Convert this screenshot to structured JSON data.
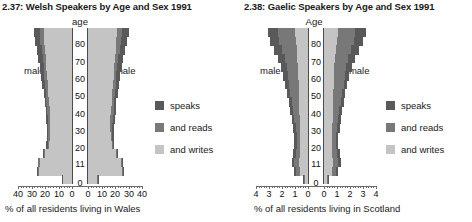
{
  "colors": {
    "speaks": "#595959",
    "and_reads": "#787878",
    "and_writes": "#c4c4c4",
    "axis": "#6b6b6b",
    "text": "#1a1a1a"
  },
  "legend": {
    "items": [
      {
        "label": "speaks",
        "color_key": "speaks"
      },
      {
        "label": "and reads",
        "color_key": "and_reads"
      },
      {
        "label": "and writes",
        "color_key": "and_writes"
      }
    ]
  },
  "panels": [
    {
      "id": "welsh",
      "title": "2.37: Welsh Speakers by Age and Sex 1991",
      "age_axis_label": "age",
      "male_label": "male",
      "female_label": "female",
      "caption": "% of all residents living in Wales",
      "age_ticks": [
        "80",
        "70",
        "60",
        "50",
        "40",
        "30",
        "20",
        "11",
        "0"
      ],
      "value_ticks_left": [
        "40",
        "30",
        "20",
        "10",
        "0"
      ],
      "value_ticks_right": [
        "0",
        "10",
        "20",
        "30",
        "40"
      ],
      "chart_data": {
        "type": "bar",
        "orientation": "population-pyramid",
        "title": "2.37: Welsh Speakers by Age and Sex 1991",
        "xlabel": "% of all residents living in Wales",
        "ylabel": "age",
        "xlim": [
          0,
          40
        ],
        "ylim": [
          0,
          90
        ],
        "grid": false,
        "legend_position": "right",
        "categories": [
          "85+",
          "80-84",
          "75-79",
          "70-74",
          "65-69",
          "60-64",
          "55-59",
          "50-54",
          "45-49",
          "40-44",
          "35-39",
          "30-34",
          "25-29",
          "20-24",
          "16-19",
          "11-15",
          "5-10",
          "3-4"
        ],
        "series": [
          {
            "name": "male speaks",
            "side": "male",
            "layer": "speaks",
            "values": [
              28.5,
              27.5,
              26.0,
              25.0,
              24.0,
              23.0,
              22.0,
              21.0,
              20.0,
              19.5,
              19.0,
              18.5,
              18.5,
              19.0,
              21.5,
              25.5,
              26.0,
              7.5
            ]
          },
          {
            "name": "male and reads",
            "side": "male",
            "layer": "and_reads",
            "values": [
              24.0,
              23.5,
              22.5,
              21.5,
              21.0,
              20.5,
              20.0,
              19.5,
              19.0,
              18.5,
              18.0,
              17.5,
              17.5,
              18.0,
              21.0,
              25.0,
              25.5,
              7.0
            ]
          },
          {
            "name": "male and writes",
            "side": "male",
            "layer": "and_writes",
            "values": [
              21.0,
              20.5,
              20.0,
              19.5,
              19.0,
              18.5,
              18.0,
              17.5,
              17.0,
              16.5,
              16.0,
              16.0,
              16.5,
              17.0,
              20.0,
              24.0,
              24.5,
              6.5
            ]
          },
          {
            "name": "female speaks",
            "side": "female",
            "layer": "speaks",
            "values": [
              30.0,
              29.0,
              27.5,
              26.0,
              25.0,
              24.0,
              23.0,
              22.0,
              21.0,
              20.5,
              20.0,
              19.5,
              19.0,
              19.5,
              22.0,
              26.0,
              26.5,
              8.0
            ]
          },
          {
            "name": "female and reads",
            "side": "female",
            "layer": "and_reads",
            "values": [
              25.0,
              24.5,
              23.5,
              22.5,
              21.5,
              21.0,
              20.5,
              20.0,
              19.5,
              19.0,
              18.5,
              18.0,
              18.0,
              18.5,
              21.5,
              25.5,
              26.0,
              7.5
            ]
          },
          {
            "name": "female and writes",
            "side": "female",
            "layer": "and_writes",
            "values": [
              21.5,
              21.0,
              20.5,
              20.0,
              19.5,
              19.0,
              18.5,
              18.0,
              17.5,
              17.0,
              16.5,
              16.5,
              17.0,
              17.5,
              20.5,
              24.5,
              25.0,
              7.0
            ]
          }
        ]
      }
    },
    {
      "id": "gaelic",
      "title": "2.38: Gaelic Speakers by Age and Sex 1991",
      "age_axis_label": "Age",
      "male_label": "male",
      "female_label": "female",
      "caption": "% of all residents living in Scotland",
      "age_ticks": [
        "80",
        "70",
        "60",
        "50",
        "40",
        "30",
        "20",
        "11",
        "0"
      ],
      "value_ticks_left": [
        "4",
        "3",
        "2",
        "1",
        "0"
      ],
      "value_ticks_right": [
        "0",
        "1",
        "2",
        "3",
        "4"
      ],
      "chart_data": {
        "type": "bar",
        "orientation": "population-pyramid",
        "title": "2.38: Gaelic Speakers by Age and Sex 1991",
        "xlabel": "% of all residents living in Scotland",
        "ylabel": "Age",
        "xlim": [
          0,
          4
        ],
        "ylim": [
          0,
          90
        ],
        "grid": false,
        "legend_position": "right",
        "categories": [
          "85+",
          "80-84",
          "75-79",
          "70-74",
          "65-69",
          "60-64",
          "55-59",
          "50-54",
          "45-49",
          "40-44",
          "35-39",
          "30-34",
          "25-29",
          "20-24",
          "16-19",
          "11-15",
          "5-10",
          "3-4"
        ],
        "series": [
          {
            "name": "male speaks",
            "side": "male",
            "layer": "speaks",
            "values": [
              3.1,
              2.95,
              2.6,
              2.3,
              2.05,
              1.9,
              1.75,
              1.6,
              1.45,
              1.35,
              1.25,
              1.15,
              1.05,
              1.05,
              1.15,
              1.25,
              1.05,
              0.35
            ]
          },
          {
            "name": "male and reads",
            "side": "male",
            "layer": "and_reads",
            "values": [
              2.3,
              2.2,
              2.0,
              1.8,
              1.65,
              1.55,
              1.45,
              1.35,
              1.25,
              1.15,
              1.05,
              0.95,
              0.88,
              0.88,
              0.95,
              1.05,
              0.9,
              0.3
            ]
          },
          {
            "name": "male and writes",
            "side": "male",
            "layer": "and_writes",
            "values": [
              1.0,
              0.95,
              0.88,
              0.82,
              0.78,
              0.75,
              0.72,
              0.7,
              0.68,
              0.66,
              0.64,
              0.62,
              0.6,
              0.6,
              0.62,
              0.66,
              0.6,
              0.2
            ]
          },
          {
            "name": "female speaks",
            "side": "female",
            "layer": "speaks",
            "values": [
              3.2,
              3.0,
              2.7,
              2.4,
              2.15,
              1.95,
              1.8,
              1.65,
              1.5,
              1.4,
              1.3,
              1.2,
              1.1,
              1.1,
              1.2,
              1.3,
              1.1,
              0.35
            ]
          },
          {
            "name": "female and reads",
            "side": "female",
            "layer": "and_reads",
            "values": [
              2.4,
              2.3,
              2.05,
              1.85,
              1.7,
              1.6,
              1.5,
              1.4,
              1.28,
              1.18,
              1.08,
              0.98,
              0.9,
              0.9,
              1.0,
              1.1,
              0.92,
              0.3
            ]
          },
          {
            "name": "female and writes",
            "side": "female",
            "layer": "and_writes",
            "values": [
              1.05,
              1.0,
              0.92,
              0.86,
              0.8,
              0.77,
              0.74,
              0.72,
              0.7,
              0.68,
              0.66,
              0.64,
              0.62,
              0.62,
              0.64,
              0.68,
              0.62,
              0.2
            ]
          }
        ]
      }
    }
  ]
}
